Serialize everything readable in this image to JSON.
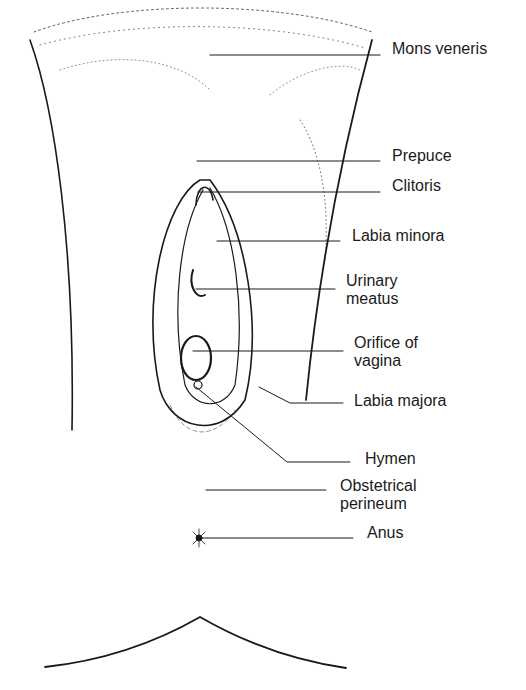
{
  "diagram": {
    "type": "labeled anatomical line drawing",
    "ink_color": "#1a1a1a",
    "background": "#ffffff",
    "labels": [
      {
        "id": "mons-veneris",
        "text": "Mons veneris",
        "x": 392,
        "y": 40,
        "line": [
          210,
          55,
          380,
          55
        ]
      },
      {
        "id": "prepuce",
        "text": "Prepuce",
        "x": 392,
        "y": 147,
        "line": [
          197,
          161,
          380,
          161
        ]
      },
      {
        "id": "clitoris",
        "text": "Clitoris",
        "x": 392,
        "y": 177,
        "line": [
          198,
          192,
          380,
          192
        ]
      },
      {
        "id": "labia-minora",
        "text": "Labia minora",
        "x": 352,
        "y": 227,
        "line": [
          217,
          241,
          340,
          241
        ]
      },
      {
        "id": "urinary-meatus",
        "text": "Urinary\nmeatus",
        "x": 346,
        "y": 272,
        "line": [
          196,
          289,
          335,
          289
        ]
      },
      {
        "id": "orifice-of-vagina",
        "text": "Orifice of\nvagina",
        "x": 354,
        "y": 334,
        "line": [
          193,
          351,
          343,
          351
        ]
      },
      {
        "id": "labia-majora",
        "text": "Labia majora",
        "x": 354,
        "y": 392,
        "line": [
          259,
          387,
          290,
          403,
          343,
          403
        ]
      },
      {
        "id": "hymen",
        "text": "Hymen",
        "x": 365,
        "y": 450,
        "line": [
          196,
          387,
          287,
          462,
          350,
          462
        ]
      },
      {
        "id": "obstetrical-perineum",
        "text": "Obstetrical\nperineum",
        "x": 340,
        "y": 477,
        "line": [
          206,
          490,
          326,
          490
        ]
      },
      {
        "id": "anus",
        "text": "Anus",
        "x": 367,
        "y": 524,
        "line": [
          198,
          538,
          353,
          538
        ]
      }
    ]
  }
}
